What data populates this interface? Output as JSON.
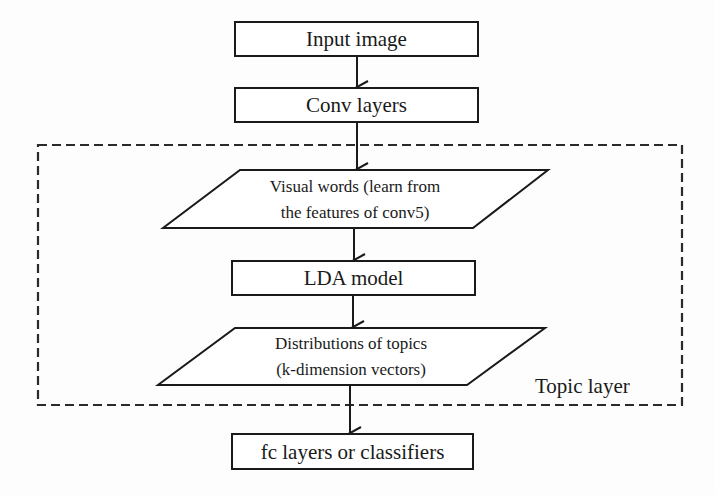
{
  "diagram": {
    "type": "flowchart",
    "direction": "top-to-bottom",
    "colors": {
      "stroke": "#1a1a1a",
      "background": "#fdfdfd",
      "group_border": "#2a2a2a"
    },
    "nodes": [
      {
        "id": "input",
        "shape": "rectangle",
        "label": "Input image"
      },
      {
        "id": "conv",
        "shape": "rectangle",
        "label": "Conv layers"
      },
      {
        "id": "visual_words",
        "shape": "parallelogram",
        "label_line1": "Visual words (learn from",
        "label_line2": "the features of conv5)"
      },
      {
        "id": "lda",
        "shape": "rectangle",
        "label": "LDA model"
      },
      {
        "id": "topic_dist",
        "shape": "parallelogram",
        "label_line1": "Distributions of topics",
        "label_line2": "(k-dimension vectors)"
      },
      {
        "id": "fc",
        "shape": "rectangle",
        "label": "fc layers or classifiers"
      }
    ],
    "edges": [
      {
        "from": "input",
        "to": "conv"
      },
      {
        "from": "conv",
        "to": "visual_words"
      },
      {
        "from": "visual_words",
        "to": "lda"
      },
      {
        "from": "lda",
        "to": "topic_dist"
      },
      {
        "from": "topic_dist",
        "to": "fc"
      }
    ],
    "groups": [
      {
        "id": "topic_layer",
        "style": "dashed",
        "label": "Topic layer",
        "contains": [
          "visual_words",
          "lda",
          "topic_dist"
        ]
      }
    ]
  }
}
